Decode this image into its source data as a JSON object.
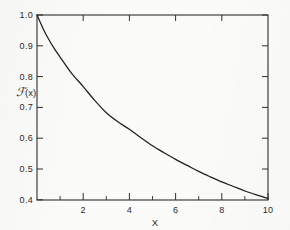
{
  "figure": {
    "background_color": "#fbfbf9",
    "ink_color": "#1f1f1f"
  },
  "chart_data": {
    "type": "line",
    "title": "",
    "subtitle": "",
    "xlabel": "X",
    "ylabel": "ℱ(x)",
    "ylabel_parts": {
      "script_symbol": "ℱ",
      "argument": "(x)"
    },
    "xlim": [
      0,
      10
    ],
    "ylim": [
      0.385,
      1.0
    ],
    "grid": false,
    "legend": null,
    "legend_position": "none",
    "frame": "full-box",
    "tick_direction": "in",
    "x_ticks_major": [
      2,
      4,
      6,
      8,
      10
    ],
    "x_tick_labels": [
      "2",
      "4",
      "6",
      "8",
      "10"
    ],
    "x_ticks_minor": [
      1,
      3,
      5,
      7,
      9
    ],
    "y_ticks_major": [
      0.4,
      0.5,
      0.6,
      0.7,
      0.8,
      0.9,
      1.0
    ],
    "y_tick_labels": [
      "0.4",
      "0.5",
      "0.6",
      "0.7",
      "0.8",
      "0.9",
      "1.0"
    ],
    "series": [
      {
        "name": "F(x)",
        "x": [
          0.0,
          0.25,
          0.5,
          0.75,
          1.0,
          1.5,
          2.0,
          2.5,
          3.0,
          3.5,
          4.0,
          4.5,
          5.0,
          5.5,
          6.0,
          6.5,
          7.0,
          7.5,
          8.0,
          8.5,
          9.0,
          9.5,
          10.0
        ],
        "values": [
          1.0,
          0.957,
          0.92,
          0.888,
          0.86,
          0.806,
          0.762,
          0.716,
          0.675,
          0.645,
          0.62,
          0.592,
          0.565,
          0.542,
          0.52,
          0.5,
          0.48,
          0.462,
          0.445,
          0.43,
          0.415,
          0.402,
          0.39
        ]
      }
    ],
    "annotations": []
  },
  "axes": {
    "x_axis_title": "X",
    "y_axis_title": "ℱ(x)"
  }
}
